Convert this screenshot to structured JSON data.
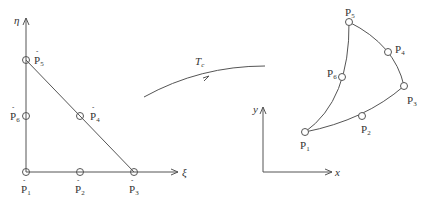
{
  "figure": {
    "reference_element": {
      "axis_labels": {
        "vertical": "η",
        "horizontal": "ξ"
      },
      "points": [
        {
          "base": "P",
          "index": "1",
          "x": 26,
          "y": 172
        },
        {
          "base": "P",
          "index": "2",
          "x": 80,
          "y": 172
        },
        {
          "base": "P",
          "index": "3",
          "x": 134,
          "y": 172
        },
        {
          "base": "P",
          "index": "4",
          "x": 80,
          "y": 116
        },
        {
          "base": "P",
          "index": "5",
          "x": 26,
          "y": 60
        },
        {
          "base": "P",
          "index": "6",
          "x": 26,
          "y": 116
        }
      ]
    },
    "mapping": {
      "label_base": "T",
      "label_sub": "c"
    },
    "physical_element": {
      "axis_labels": {
        "vertical": "y",
        "horizontal": "x"
      },
      "points": [
        {
          "base": "P",
          "index": "1",
          "x": 305,
          "y": 132
        },
        {
          "base": "P",
          "index": "2",
          "x": 362,
          "y": 116
        },
        {
          "base": "P",
          "index": "3",
          "x": 404,
          "y": 86
        },
        {
          "base": "P",
          "index": "4",
          "x": 388,
          "y": 52
        },
        {
          "base": "P",
          "index": "5",
          "x": 349,
          "y": 22
        },
        {
          "base": "P",
          "index": "6",
          "x": 342,
          "y": 77
        }
      ]
    },
    "colors": {
      "stroke": "#555555",
      "text": "#333333",
      "background": "#ffffff"
    }
  }
}
